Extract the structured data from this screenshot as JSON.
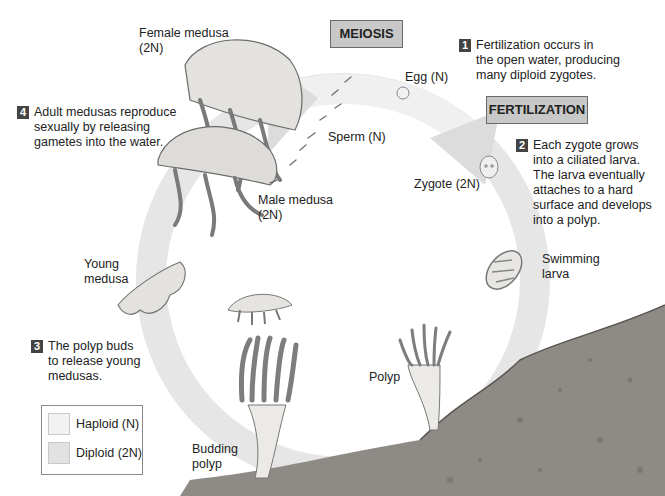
{
  "diagram": {
    "type": "life-cycle",
    "colors": {
      "ring": "#e6e6e6",
      "arrow": "#dcdcdc",
      "phase_box": "#c8c8c8",
      "step_badge": "#444444",
      "rock": "#8e8a85",
      "haploid_swatch": "#f2f2f2",
      "diploid_swatch": "#e2e2e2"
    },
    "phases": {
      "meiosis": "MEIOSIS",
      "fertilization": "FERTILIZATION"
    },
    "labels": {
      "female_medusa": "Female medusa",
      "female_ploidy": "(2N)",
      "male_medusa": "Male medusa",
      "male_ploidy": "(2N)",
      "egg": "Egg (N)",
      "sperm": "Sperm (N)",
      "zygote": "Zygote (2N)",
      "swimming_larva_1": "Swimming",
      "swimming_larva_2": "larva",
      "polyp": "Polyp",
      "budding_polyp_1": "Budding",
      "budding_polyp_2": "polyp",
      "young_medusa_1": "Young",
      "young_medusa_2": "medusa"
    },
    "steps": [
      {
        "number": "1",
        "lines": [
          "Fertilization occurs in",
          "the open water, producing",
          "many diploid zygotes."
        ]
      },
      {
        "number": "2",
        "lines": [
          "Each zygote grows",
          "into a ciliated larva.",
          "The larva eventually",
          "attaches to a hard",
          "surface and develops",
          "into a polyp."
        ]
      },
      {
        "number": "3",
        "lines": [
          "The polyp buds",
          "to release young",
          "medusas."
        ]
      },
      {
        "number": "4",
        "lines": [
          "Adult medusas reproduce",
          "sexually by releasing",
          "gametes into the water."
        ]
      }
    ],
    "legend": {
      "items": [
        {
          "label": "Haploid (N)"
        },
        {
          "label": "Diploid (2N)"
        }
      ]
    }
  }
}
